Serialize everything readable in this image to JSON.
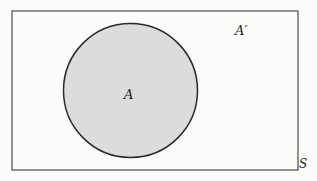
{
  "diagram": {
    "type": "venn",
    "universal_set": {
      "label": "S",
      "stroke_color": "#5a5a5a",
      "fill_color": "#fbfbfa"
    },
    "sets": [
      {
        "label": "A",
        "fill_color": "#dcdcdc",
        "stroke_color": "#2a2a2a"
      }
    ],
    "regions": [
      {
        "label": "A′",
        "description": "complement of A within S"
      }
    ]
  },
  "labels": {
    "set_a": "A",
    "complement": "A′",
    "universe": "S"
  }
}
